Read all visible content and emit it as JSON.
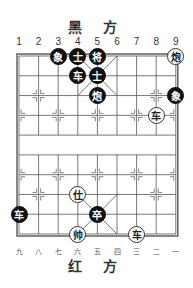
{
  "header": {
    "top_side": "黑 方",
    "bottom_side": "红 方"
  },
  "top_numbers": [
    "1",
    "2",
    "3",
    "4",
    "5",
    "6",
    "7",
    "8",
    "9"
  ],
  "bottom_numbers": [
    "九",
    "八",
    "七",
    "六",
    "五",
    "四",
    "三",
    "二",
    "一"
  ],
  "board": {
    "left": 19,
    "top": 56,
    "col_step": 19.6,
    "row_step": 19.78,
    "cols": 9,
    "rows": 10
  },
  "colors": {
    "line": "#555555",
    "black_piece": "#111111",
    "red_piece_bg": "#ffffff"
  },
  "pieces": [
    {
      "side": "black",
      "label": "象",
      "col": 3,
      "row": 0
    },
    {
      "side": "black",
      "label": "士",
      "col": 4,
      "row": 0
    },
    {
      "side": "black",
      "label": "将",
      "col": 5,
      "row": 0
    },
    {
      "side": "red",
      "label": "炮",
      "col": 9,
      "row": 0
    },
    {
      "side": "black",
      "label": "车",
      "col": 4,
      "row": 1
    },
    {
      "side": "black",
      "label": "士",
      "col": 5,
      "row": 1
    },
    {
      "side": "black",
      "label": "炮",
      "col": 5,
      "row": 2
    },
    {
      "side": "black",
      "label": "象",
      "col": 9,
      "row": 2
    },
    {
      "side": "red",
      "label": "车",
      "col": 8,
      "row": 3
    },
    {
      "side": "red",
      "label": "仕",
      "col": 4,
      "row": 7
    },
    {
      "side": "black",
      "label": "车",
      "col": 1,
      "row": 8
    },
    {
      "side": "black",
      "label": "卒",
      "col": 5,
      "row": 8
    },
    {
      "side": "red",
      "label": "帅",
      "col": 4,
      "row": 9
    },
    {
      "side": "red",
      "label": "车",
      "col": 7,
      "row": 9
    }
  ]
}
